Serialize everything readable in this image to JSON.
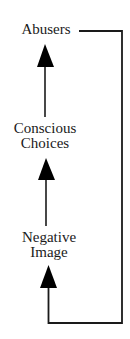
{
  "diagram": {
    "type": "feedback-cycle",
    "colors": {
      "line": "#1a1a1a",
      "arrowhead": "#000000",
      "text": "#1a1a1a",
      "background": "#ffffff"
    },
    "nodes": [
      {
        "id": "abusers",
        "lines": [
          "Abusers"
        ]
      },
      {
        "id": "conscious-choices",
        "lines": [
          "Conscious",
          "Choices"
        ]
      },
      {
        "id": "negative-image",
        "lines": [
          "Negative",
          "Image"
        ]
      }
    ],
    "edges": [
      {
        "from": "conscious-choices",
        "to": "abusers",
        "style": "arrow-up"
      },
      {
        "from": "negative-image",
        "to": "conscious-choices",
        "style": "arrow-up"
      },
      {
        "from": "abusers",
        "to": "negative-image",
        "style": "loop-right-arrow-up"
      }
    ]
  }
}
